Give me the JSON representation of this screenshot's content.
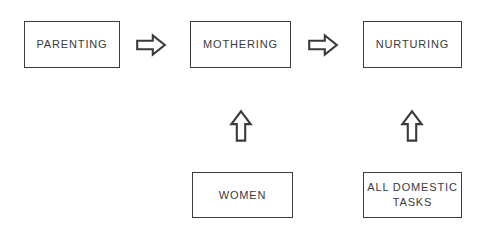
{
  "diagram": {
    "type": "flowchart",
    "background_color": "#ffffff",
    "line_color": "#3b3b3d",
    "text_color": "#3a3a3c",
    "nodes": [
      {
        "id": "parenting",
        "label": "PARENTING",
        "row": "top",
        "column": 1
      },
      {
        "id": "mothering",
        "label": "MOTHERING",
        "row": "top",
        "column": 2
      },
      {
        "id": "nurturing",
        "label": "NURTURING",
        "row": "top",
        "column": 3
      },
      {
        "id": "women",
        "label": "WOMEN",
        "row": "bottom",
        "column": 2
      },
      {
        "id": "domestic_tasks",
        "label": "ALL DOMESTIC\nTASKS",
        "row": "bottom",
        "column": 3
      }
    ],
    "connectors": [
      {
        "id": "parenting_to_mothering",
        "from": "parenting",
        "to": "mothering",
        "direction": "right",
        "glyph": "right-arrow"
      },
      {
        "id": "mothering_to_nurturing",
        "from": "mothering",
        "to": "nurturing",
        "direction": "right",
        "glyph": "right-arrow"
      },
      {
        "id": "women_to_mothering",
        "from": "women",
        "to": "mothering",
        "direction": "up",
        "glyph": "up-arrow"
      },
      {
        "id": "tasks_to_nurturing",
        "from": "domestic_tasks",
        "to": "nurturing",
        "direction": "up",
        "glyph": "up-arrow"
      }
    ]
  }
}
